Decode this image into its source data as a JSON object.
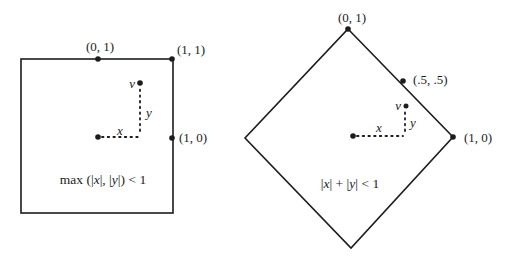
{
  "colors": {
    "ink": "#1c1c1c",
    "background": "#ffffff"
  },
  "square_figure": {
    "point_labels": {
      "top_mid": "(0, 1)",
      "top_right": "(1, 1)",
      "right_mid": "(1, 0)"
    },
    "vector_labels": {
      "v": "v",
      "x": "x",
      "y": "y"
    },
    "caption": {
      "p1": "max (|",
      "x": "x",
      "p2": "|, |",
      "y": "y",
      "p3": "|) < 1"
    }
  },
  "diamond_figure": {
    "point_labels": {
      "top": "(0, 1)",
      "upper_right_mid": "(.5, .5)",
      "right": "(1, 0)"
    },
    "vector_labels": {
      "v": "v",
      "x": "x",
      "y": "y"
    },
    "caption": {
      "p1": "|",
      "x": "x",
      "p2": "| + |",
      "y": "y",
      "p3": "| < 1"
    }
  }
}
